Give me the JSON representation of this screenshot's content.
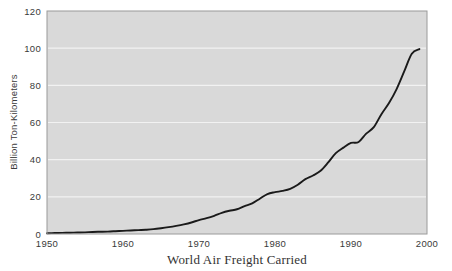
{
  "chart_data": {
    "type": "line",
    "title": "World Air Freight Carried",
    "xlabel": "",
    "ylabel": "Billion Ton-Kilometers",
    "xlim": [
      1950,
      2000
    ],
    "ylim": [
      0,
      120
    ],
    "grid": true,
    "legend": "none",
    "x_ticks": [
      1950,
      1960,
      1970,
      1980,
      1990,
      2000
    ],
    "x_tick_labels": [
      "1950",
      "1960",
      "1970",
      "1980",
      "1990",
      "2000"
    ],
    "y_ticks": [
      0,
      20,
      40,
      60,
      80,
      100,
      120
    ],
    "y_tick_labels": [
      "0",
      "20",
      "40",
      "60",
      "80",
      "100",
      "120"
    ],
    "series": [
      {
        "name": "World Air Freight Carried",
        "color": "#1a1a1a",
        "x": [
          1950,
          1951,
          1952,
          1953,
          1954,
          1955,
          1956,
          1957,
          1958,
          1959,
          1960,
          1961,
          1962,
          1963,
          1964,
          1965,
          1966,
          1967,
          1968,
          1969,
          1970,
          1971,
          1972,
          1973,
          1974,
          1975,
          1976,
          1977,
          1978,
          1979,
          1980,
          1981,
          1982,
          1983,
          1984,
          1985,
          1986,
          1987,
          1988,
          1989,
          1990,
          1991,
          1992,
          1993,
          1994,
          1995,
          1996,
          1997,
          1998,
          1999
        ],
        "values": [
          0.4,
          0.5,
          0.6,
          0.7,
          0.8,
          0.9,
          1.1,
          1.2,
          1.3,
          1.5,
          1.7,
          1.9,
          2.1,
          2.3,
          2.6,
          3.1,
          3.7,
          4.4,
          5.2,
          6.2,
          7.5,
          8.5,
          9.8,
          11.4,
          12.5,
          13.3,
          15.0,
          16.5,
          19.0,
          21.5,
          22.5,
          23.2,
          24.3,
          26.5,
          29.5,
          31.5,
          34.0,
          38.5,
          43.5,
          46.5,
          49.0,
          49.5,
          54.0,
          57.5,
          64.5,
          70.5,
          78.0,
          87.5,
          97.0,
          99.5
        ]
      }
    ]
  },
  "plot": {
    "background_color": "#d9d9d9",
    "gridline_color": "#f2f2f2",
    "border_color": "#9a9a9a",
    "page_background": "#ffffff"
  }
}
